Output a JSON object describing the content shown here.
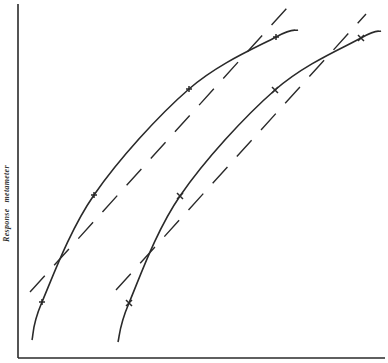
{
  "chart_data": {
    "type": "line",
    "title": "",
    "xlabel": "",
    "ylabel": "Response metameter",
    "ylabel_parts": [
      "Response",
      "metameter"
    ],
    "grid": false,
    "legend": null,
    "axes": {
      "y_axis": {
        "x": 18,
        "y1": 4,
        "y2": 358
      },
      "x_axis": {
        "y": 358,
        "x1": 18,
        "x2": 385
      },
      "ticks": "none"
    },
    "series": [
      {
        "name": "Curve A (observed)",
        "style": "solid",
        "points_px": [
          [
            32,
            340
          ],
          [
            42,
            302
          ],
          [
            94,
            195
          ],
          [
            189,
            89
          ],
          [
            276,
            37
          ],
          [
            298,
            30
          ]
        ],
        "markers_px": [
          [
            42,
            302
          ],
          [
            94,
            195
          ],
          [
            189,
            89
          ],
          [
            276,
            37
          ]
        ],
        "marker": "+"
      },
      {
        "name": "Line A (fitted)",
        "style": "dashed",
        "points_px": [
          [
            30,
            292
          ],
          [
            287,
            8
          ]
        ]
      },
      {
        "name": "Curve B (observed)",
        "style": "solid",
        "points_px": [
          [
            118,
            342
          ],
          [
            129,
            303
          ],
          [
            180,
            196
          ],
          [
            275,
            90
          ],
          [
            361,
            38
          ],
          [
            381,
            31
          ]
        ],
        "markers_px": [
          [
            129,
            303
          ],
          [
            180,
            196
          ],
          [
            275,
            90
          ],
          [
            361,
            38
          ]
        ],
        "marker": "x"
      },
      {
        "name": "Line B (fitted)",
        "style": "dashed",
        "points_px": [
          [
            116,
            290
          ],
          [
            366,
            14
          ]
        ]
      }
    ]
  },
  "colors": {
    "ink": "#2a2a2a",
    "background": "#ffffff"
  }
}
